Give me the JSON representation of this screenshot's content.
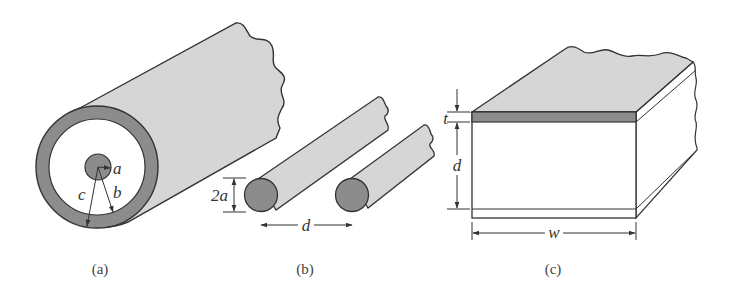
{
  "figure": {
    "panels": [
      {
        "id": "a",
        "caption": "(a)",
        "description": "Coaxial line",
        "labels": {
          "inner_radius": "a",
          "outer_radius": "b",
          "shield_radius": "c"
        }
      },
      {
        "id": "b",
        "caption": "(b)",
        "description": "Two-wire line",
        "labels": {
          "diameter": "2a",
          "separation": "d"
        }
      },
      {
        "id": "c",
        "caption": "(c)",
        "description": "Parallel-plate line",
        "labels": {
          "thickness": "t",
          "spacing": "d",
          "width": "w"
        }
      }
    ],
    "colors": {
      "conductor_dark": "#8c8c8c",
      "surface_light": "#d6d6d6",
      "outline": "#333333",
      "background": "#ffffff"
    }
  }
}
